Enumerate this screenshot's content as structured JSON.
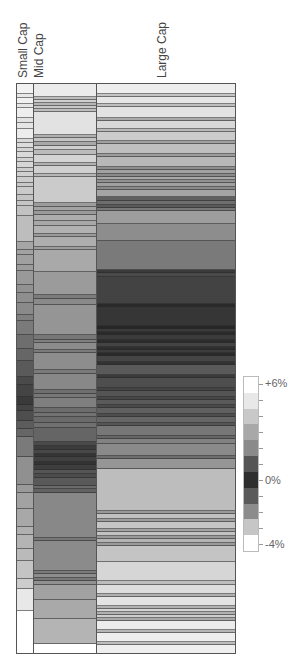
{
  "chart_data": {
    "type": "heatmap",
    "title": "",
    "columns": [
      "Small Cap",
      "Mid Cap",
      "Large Cap"
    ],
    "legend": {
      "labels": [
        "+6%",
        "0%",
        "-4%"
      ],
      "ticks": 11,
      "colors": [
        "#ffffff",
        "#e8e8e8",
        "#c8c8c8",
        "#a8a8a8",
        "#8a8a8a",
        "#555555",
        "#2e2e2e",
        "#5a5a5a",
        "#8c8c8c",
        "#c6c6c6",
        "#ffffff"
      ]
    },
    "bands": {
      "small_cap": [
        [
          10,
          "#f2f2f2"
        ],
        [
          4,
          "#e8e8e8"
        ],
        [
          6,
          "#f0f0f0"
        ],
        [
          4,
          "#e6e6e6"
        ],
        [
          10,
          "#eeeeee"
        ],
        [
          5,
          "#e2e2e2"
        ],
        [
          6,
          "#e6e6e6"
        ],
        [
          10,
          "#ececec"
        ],
        [
          4,
          "#d8d8d8"
        ],
        [
          5,
          "#dcdcdc"
        ],
        [
          4,
          "#d4d4d4"
        ],
        [
          6,
          "#dadada"
        ],
        [
          4,
          "#d2d2d2"
        ],
        [
          6,
          "#d6d6d6"
        ],
        [
          4,
          "#cdcdcd"
        ],
        [
          5,
          "#d0d0d0"
        ],
        [
          6,
          "#cccccc"
        ],
        [
          4,
          "#c8c8c8"
        ],
        [
          8,
          "#cacaca"
        ],
        [
          6,
          "#c4c4c4"
        ],
        [
          5,
          "#c6c6c6"
        ],
        [
          10,
          "#c2c2c2"
        ],
        [
          26,
          "#bdbdbd"
        ],
        [
          8,
          "#a6a6a6"
        ],
        [
          5,
          "#a2a2a2"
        ],
        [
          10,
          "#a0a0a0"
        ],
        [
          6,
          "#9c9c9c"
        ],
        [
          14,
          "#999999"
        ],
        [
          8,
          "#929292"
        ],
        [
          10,
          "#8e8e8e"
        ],
        [
          12,
          "#8a8a8a"
        ],
        [
          6,
          "#808080"
        ],
        [
          14,
          "#7a7a7a"
        ],
        [
          14,
          "#6e6e6e"
        ],
        [
          12,
          "#666666"
        ],
        [
          16,
          "#5a5a5a"
        ],
        [
          8,
          "#4a4a4a"
        ],
        [
          12,
          "#444444"
        ],
        [
          8,
          "#3a3a3a"
        ],
        [
          6,
          "#444444"
        ],
        [
          10,
          "#4e4e4e"
        ],
        [
          8,
          "#5c5c5c"
        ],
        [
          8,
          "#666666"
        ],
        [
          20,
          "#7a7a7a"
        ],
        [
          28,
          "#909090"
        ],
        [
          8,
          "#9a9a9a"
        ],
        [
          16,
          "#a2a2a2"
        ],
        [
          18,
          "#a8a8a8"
        ],
        [
          8,
          "#b0b0b0"
        ],
        [
          14,
          "#b4b4b4"
        ],
        [
          12,
          "#bababa"
        ],
        [
          18,
          "#c4c4c4"
        ],
        [
          10,
          "#cccccc"
        ],
        [
          22,
          "#e8e8e8"
        ]
      ],
      "mid_cap": [
        [
          13,
          "#ebebeb"
        ],
        [
          3,
          "#bdbdbd"
        ],
        [
          3,
          "#d0d0d0"
        ],
        [
          3,
          "#b5b5b5"
        ],
        [
          3,
          "#c8c8c8"
        ],
        [
          3,
          "#bdbdbd"
        ],
        [
          23,
          "#e2e2e2"
        ],
        [
          3,
          "#b0b0b0"
        ],
        [
          4,
          "#c4c4c4"
        ],
        [
          4,
          "#a8a8a8"
        ],
        [
          4,
          "#cfcfcf"
        ],
        [
          5,
          "#bbbbbb"
        ],
        [
          8,
          "#d4d4d4"
        ],
        [
          3,
          "#b0b0b0"
        ],
        [
          8,
          "#d0d0d0"
        ],
        [
          3,
          "#b6b6b6"
        ],
        [
          26,
          "#cbcbcb"
        ],
        [
          4,
          "#9c9c9c"
        ],
        [
          4,
          "#a4a4a4"
        ],
        [
          4,
          "#9a9a9a"
        ],
        [
          6,
          "#adadad"
        ],
        [
          5,
          "#a8a8a8"
        ],
        [
          8,
          "#b2b2b2"
        ],
        [
          3,
          "#9a9a9a"
        ],
        [
          10,
          "#aeaeae"
        ],
        [
          3,
          "#9c9c9c"
        ],
        [
          22,
          "#a9a9a9"
        ],
        [
          23,
          "#9b9b9b"
        ],
        [
          4,
          "#7c7c7c"
        ],
        [
          6,
          "#8a8a8a"
        ],
        [
          30,
          "#959595"
        ],
        [
          5,
          "#777777"
        ],
        [
          3,
          "#7f7f7f"
        ],
        [
          7,
          "#8c8c8c"
        ],
        [
          3,
          "#7a7a7a"
        ],
        [
          17,
          "#8d8d8d"
        ],
        [
          4,
          "#7a7a7a"
        ],
        [
          16,
          "#888888"
        ],
        [
          4,
          "#6e6e6e"
        ],
        [
          4,
          "#777777"
        ],
        [
          10,
          "#7f7f7f"
        ],
        [
          5,
          "#6c6c6c"
        ],
        [
          4,
          "#727272"
        ],
        [
          6,
          "#6a6a6a"
        ],
        [
          5,
          "#707070"
        ],
        [
          14,
          "#656565"
        ],
        [
          4,
          "#4a4a4a"
        ],
        [
          4,
          "#3c3c3c"
        ],
        [
          4,
          "#474747"
        ],
        [
          3,
          "#353535"
        ],
        [
          5,
          "#404040"
        ],
        [
          3,
          "#333333"
        ],
        [
          5,
          "#3e3e3e"
        ],
        [
          4,
          "#555555"
        ],
        [
          4,
          "#4c4c4c"
        ],
        [
          8,
          "#595959"
        ],
        [
          3,
          "#6a6a6a"
        ],
        [
          4,
          "#626262"
        ],
        [
          45,
          "#888888"
        ],
        [
          3,
          "#777777"
        ],
        [
          30,
          "#8b8b8b"
        ],
        [
          3,
          "#7a7a7a"
        ],
        [
          4,
          "#8d8d8d"
        ],
        [
          3,
          "#777777"
        ],
        [
          4,
          "#919191"
        ],
        [
          15,
          "#a2a2a2"
        ],
        [
          19,
          "#a9a9a9"
        ],
        [
          25,
          "#b4b4b4"
        ]
      ],
      "large_cap": [
        [
          10,
          "#eeeeee"
        ],
        [
          3,
          "#c4c4c4"
        ],
        [
          7,
          "#e6e6e6"
        ],
        [
          3,
          "#bfbfbf"
        ],
        [
          11,
          "#e2e2e2"
        ],
        [
          3,
          "#a9a9a9"
        ],
        [
          8,
          "#d8d8d8"
        ],
        [
          3,
          "#b9b9b9"
        ],
        [
          9,
          "#cccccc"
        ],
        [
          3,
          "#a0a0a0"
        ],
        [
          10,
          "#bfbfbf"
        ],
        [
          3,
          "#9c9c9c"
        ],
        [
          10,
          "#b8b8b8"
        ],
        [
          3,
          "#8e8e8e"
        ],
        [
          4,
          "#a2a2a2"
        ],
        [
          3,
          "#8a8a8a"
        ],
        [
          3,
          "#a8a8a8"
        ],
        [
          3,
          "#919191"
        ],
        [
          4,
          "#a0a0a0"
        ],
        [
          3,
          "#8a8a8a"
        ],
        [
          7,
          "#a4a4a4"
        ],
        [
          4,
          "#606060"
        ],
        [
          4,
          "#6e6e6e"
        ],
        [
          3,
          "#5a5a5a"
        ],
        [
          3,
          "#777777"
        ],
        [
          13,
          "#9d9d9d"
        ],
        [
          17,
          "#8d8d8d"
        ],
        [
          29,
          "#7a7a7a"
        ],
        [
          3,
          "#3a3a3a"
        ],
        [
          4,
          "#4a4a4a"
        ],
        [
          27,
          "#434343"
        ],
        [
          3,
          "#2a2a2a"
        ],
        [
          19,
          "#363636"
        ],
        [
          3,
          "#262626"
        ],
        [
          3,
          "#3a3a3a"
        ],
        [
          3,
          "#2a2a2a"
        ],
        [
          5,
          "#3b3b3b"
        ],
        [
          3,
          "#2c2c2c"
        ],
        [
          4,
          "#444444"
        ],
        [
          3,
          "#2e2e2e"
        ],
        [
          3,
          "#3c3c3c"
        ],
        [
          3,
          "#2a2a2a"
        ],
        [
          6,
          "#454545"
        ],
        [
          3,
          "#333333"
        ],
        [
          10,
          "#5a5a5a"
        ],
        [
          3,
          "#3a3a3a"
        ],
        [
          10,
          "#4e4e4e"
        ],
        [
          3,
          "#444444"
        ],
        [
          6,
          "#555555"
        ],
        [
          3,
          "#474747"
        ],
        [
          5,
          "#5a5a5a"
        ],
        [
          3,
          "#4a4a4a"
        ],
        [
          6,
          "#606060"
        ],
        [
          3,
          "#4e4e4e"
        ],
        [
          6,
          "#666666"
        ],
        [
          3,
          "#555555"
        ],
        [
          10,
          "#777777"
        ],
        [
          3,
          "#666666"
        ],
        [
          5,
          "#828282"
        ],
        [
          12,
          "#8a8a8a"
        ],
        [
          3,
          "#6e6e6e"
        ],
        [
          10,
          "#969696"
        ],
        [
          42,
          "#bdbdbd"
        ],
        [
          3,
          "#999999"
        ],
        [
          5,
          "#c0c0c0"
        ],
        [
          3,
          "#9e9e9e"
        ],
        [
          7,
          "#c6c6c6"
        ],
        [
          3,
          "#a4a4a4"
        ],
        [
          4,
          "#c2c2c2"
        ],
        [
          3,
          "#999999"
        ],
        [
          4,
          "#b4b4b4"
        ],
        [
          3,
          "#9a9a9a"
        ],
        [
          16,
          "#c4c4c4"
        ],
        [
          19,
          "#d6d6d6"
        ],
        [
          4,
          "#bcbcbc"
        ],
        [
          9,
          "#dddddd"
        ],
        [
          3,
          "#b0b0b0"
        ],
        [
          9,
          "#e4e4e4"
        ],
        [
          3,
          "#b2b2b2"
        ],
        [
          3,
          "#d4d4d4"
        ],
        [
          3,
          "#b0b0b0"
        ],
        [
          3,
          "#cecece"
        ],
        [
          3,
          "#a8a8a8"
        ],
        [
          9,
          "#ececec"
        ],
        [
          3,
          "#b6b6b6"
        ],
        [
          9,
          "#eeeeee"
        ],
        [
          3,
          "#bcbcbc"
        ],
        [
          9,
          "#efefef"
        ],
        [
          3,
          "#b8b8b8"
        ],
        [
          3,
          "#dcdcdc"
        ],
        [
          3,
          "#bbbbbb"
        ],
        [
          3,
          "#dadada"
        ],
        [
          3,
          "#b0b0b0"
        ],
        [
          3,
          "#d4d4d4"
        ],
        [
          3,
          "#b0b0b0"
        ],
        [
          30,
          "#ffffff"
        ]
      ]
    }
  },
  "columns": {
    "small_cap": {
      "label": "Small Cap"
    },
    "mid_cap": {
      "label": "Mid Cap"
    },
    "large_cap": {
      "label": "Large Cap"
    }
  },
  "legend": {
    "top_label": "+6%",
    "mid_label": "0%",
    "bottom_label": "-4%"
  }
}
